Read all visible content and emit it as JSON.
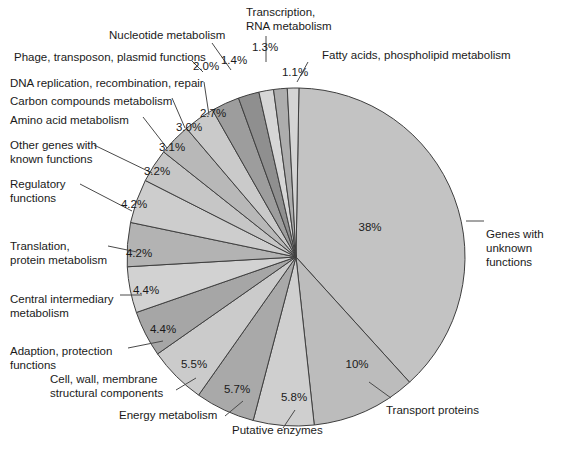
{
  "chart_data": {
    "type": "pie",
    "title": "",
    "subtitle": "",
    "xlabel": "",
    "ylabel": "",
    "legend_position": "none",
    "grid": false,
    "value_unit": "%",
    "categories": [
      "Genes with unknown functions",
      "Transport proteins",
      "Putative enzymes",
      "Energy metabolism",
      "Cell, wall, membrane structural components",
      "Adaption, protection functions",
      "Central intermediary metabolism",
      "Translation, protein metabolism",
      "Regulatory functions",
      "Other genes with known functions",
      "Amino acid metabolism",
      "Carbon compounds metabolism",
      "DNA replication, recombination, repair",
      "Phage, transposon, plasmid functions",
      "Nucleotide metabolism",
      "Transcription, RNA metabolism",
      "Fatty acids, phospholipid metabolism"
    ],
    "values": [
      38,
      10,
      5.8,
      5.7,
      5.5,
      4.4,
      4.4,
      4.2,
      4.2,
      3.2,
      3.1,
      3.0,
      2.7,
      2.0,
      1.4,
      1.3,
      1.1
    ],
    "value_labels": [
      "38%",
      "10%",
      "5.8%",
      "5.7%",
      "5.5%",
      "4.4%",
      "4.4%",
      "4.2%",
      "4.2%",
      "3.2%",
      "3.1%",
      "3.0%",
      "2.7%",
      "2.0%",
      "1.4%",
      "1.3%",
      "1.1%"
    ],
    "colors": [
      "#c3c3c3",
      "#bcbcbc",
      "#cfcfcf",
      "#a9a9a9",
      "#cbcbcb",
      "#a6a6a6",
      "#d2d2d2",
      "#b3b3b3",
      "#cdcdcd",
      "#c6c6c6",
      "#b8b8b8",
      "#cacaca",
      "#9d9d9d",
      "#8f8f8f",
      "#d6d6d6",
      "#adadad",
      "#d4d4d4"
    ]
  },
  "slices": [
    {
      "id": "genes-unknown",
      "label": "Genes with\nunknown functions",
      "pct": "38%",
      "value": 38,
      "color": "#c3c3c3"
    },
    {
      "id": "transport-proteins",
      "label": "Transport proteins",
      "pct": "10%",
      "value": 10,
      "color": "#bcbcbc"
    },
    {
      "id": "putative-enzymes",
      "label": "Putative enzymes",
      "pct": "5.8%",
      "value": 5.8,
      "color": "#cfcfcf"
    },
    {
      "id": "energy-metabolism",
      "label": "Energy metabolism",
      "pct": "5.7%",
      "value": 5.7,
      "color": "#a9a9a9"
    },
    {
      "id": "cell-wall-membrane",
      "label": "Cell, wall, membrane\nstructural components",
      "pct": "5.5%",
      "value": 5.5,
      "color": "#cbcbcb"
    },
    {
      "id": "adaption-protection",
      "label": "Adaption, protection\nfunctions",
      "pct": "4.4%",
      "value": 4.4,
      "color": "#a6a6a6"
    },
    {
      "id": "central-intermediary",
      "label": "Central intermediary\nmetabolism",
      "pct": "4.4%",
      "value": 4.4,
      "color": "#d2d2d2"
    },
    {
      "id": "translation-protein",
      "label": "Translation,\nprotein metabolism",
      "pct": "4.2%",
      "value": 4.2,
      "color": "#b3b3b3"
    },
    {
      "id": "regulatory-functions",
      "label": "Regulatory\nfunctions",
      "pct": "4.2%",
      "value": 4.2,
      "color": "#cdcdcd"
    },
    {
      "id": "other-known",
      "label": "Other genes with\nknown functions",
      "pct": "3.2%",
      "value": 3.2,
      "color": "#c6c6c6"
    },
    {
      "id": "amino-acid",
      "label": "Amino acid metabolism",
      "pct": "3.1%",
      "value": 3.1,
      "color": "#b8b8b8"
    },
    {
      "id": "carbon-compounds",
      "label": "Carbon compounds metabolism",
      "pct": "3.0%",
      "value": 3.0,
      "color": "#cacaca"
    },
    {
      "id": "dna-replication",
      "label": "DNA replication, recombination, repair",
      "pct": "2.7%",
      "value": 2.7,
      "color": "#9d9d9d"
    },
    {
      "id": "phage-transposon",
      "label": "Phage, transposon, plasmid functions",
      "pct": "2.0%",
      "value": 2.0,
      "color": "#8f8f8f"
    },
    {
      "id": "nucleotide",
      "label": "Nucleotide metabolism",
      "pct": "1.4%",
      "value": 1.4,
      "color": "#d6d6d6"
    },
    {
      "id": "transcription-rna",
      "label": "Transcription,\nRNA metabolism",
      "pct": "1.3%",
      "value": 1.3,
      "color": "#adadad"
    },
    {
      "id": "fatty-acids",
      "label": "Fatty acids, phospholipid metabolism",
      "pct": "1.1%",
      "value": 1.1,
      "color": "#d4d4d4"
    }
  ],
  "geometry": {
    "cx": 296,
    "cy": 257,
    "r": 169,
    "start_angle_deg": -89
  },
  "label_positions": {
    "genes-unknown": {
      "x": 486,
      "y": 227,
      "align": "left"
    },
    "transport-proteins": {
      "x": 386,
      "y": 403,
      "align": "left"
    },
    "putative-enzymes": {
      "x": 232,
      "y": 423,
      "align": "left"
    },
    "energy-metabolism": {
      "x": 119,
      "y": 408,
      "align": "left"
    },
    "cell-wall-membrane": {
      "x": 50,
      "y": 372,
      "align": "left"
    },
    "adaption-protection": {
      "x": 10,
      "y": 344,
      "align": "left"
    },
    "central-intermediary": {
      "x": 10,
      "y": 292,
      "align": "left"
    },
    "translation-protein": {
      "x": 10,
      "y": 239,
      "align": "left"
    },
    "regulatory-functions": {
      "x": 10,
      "y": 177,
      "align": "left"
    },
    "other-known": {
      "x": 10,
      "y": 138,
      "align": "left"
    },
    "amino-acid": {
      "x": 10,
      "y": 113,
      "align": "left"
    },
    "carbon-compounds": {
      "x": 10,
      "y": 94,
      "align": "left"
    },
    "dna-replication": {
      "x": 10,
      "y": 76,
      "align": "left"
    },
    "phage-transposon": {
      "x": 14,
      "y": 50,
      "align": "left"
    },
    "nucleotide": {
      "x": 109,
      "y": 28,
      "align": "left"
    },
    "transcription-rna": {
      "x": 246,
      "y": 5,
      "align": "left"
    },
    "fatty-acids": {
      "x": 322,
      "y": 48,
      "align": "left"
    }
  },
  "pct_positions": {
    "genes-unknown": {
      "x": 370,
      "y": 231
    },
    "transport-proteins": {
      "x": 357,
      "y": 368
    },
    "putative-enzymes": {
      "x": 294,
      "y": 401
    },
    "energy-metabolism": {
      "x": 237,
      "y": 393
    },
    "cell-wall-membrane": {
      "x": 194,
      "y": 368
    },
    "adaption-protection": {
      "x": 163,
      "y": 333
    },
    "central-intermediary": {
      "x": 146,
      "y": 294
    },
    "translation-protein": {
      "x": 139,
      "y": 257
    },
    "regulatory-functions": {
      "x": 134,
      "y": 208
    },
    "other-known": {
      "x": 157,
      "y": 175
    },
    "amino-acid": {
      "x": 172,
      "y": 151
    },
    "carbon-compounds": {
      "x": 189,
      "y": 131
    },
    "dna-replication": {
      "x": 213,
      "y": 117
    },
    "phage-transposon": {
      "x": 206,
      "y": 70
    },
    "nucleotide": {
      "x": 234,
      "y": 64
    },
    "transcription-rna": {
      "x": 265,
      "y": 51
    },
    "fatty-acids": {
      "x": 295,
      "y": 76
    }
  },
  "leaders": {
    "genes-unknown": [
      [
        466,
        221
      ],
      [
        484,
        221
      ]
    ],
    "transport-proteins": [
      [
        369,
        382
      ],
      [
        391,
        398
      ]
    ],
    "putative-enzymes": [
      [
        295,
        410
      ],
      [
        283,
        428
      ]
    ],
    "energy-metabolism": [
      [
        243,
        401
      ],
      [
        225,
        416
      ]
    ],
    "cell-wall-membrane": [
      [
        196,
        378
      ],
      [
        176,
        390
      ]
    ],
    "adaption-protection": [
      [
        163,
        341
      ],
      [
        128,
        348
      ]
    ],
    "central-intermediary": [
      [
        142,
        295
      ],
      [
        120,
        295
      ]
    ],
    "translation-protein": [
      [
        137,
        252
      ],
      [
        108,
        246
      ]
    ],
    "regulatory-functions": [
      [
        132,
        211
      ],
      [
        80,
        184
      ]
    ],
    "other-known": [
      [
        152,
        173
      ],
      [
        94,
        145
      ]
    ],
    "amino-acid": [
      [
        167,
        148
      ],
      [
        143,
        117
      ]
    ],
    "carbon-compounds": [
      [
        185,
        128
      ],
      [
        172,
        98
      ]
    ],
    "dna-replication": [
      [
        209,
        115
      ],
      [
        204,
        82
      ]
    ],
    "phage-transposon": [
      [
        203,
        72
      ],
      [
        192,
        61
      ]
    ],
    "nucleotide": [
      [
        231,
        70
      ],
      [
        212,
        43
      ]
    ],
    "transcription-rna": [
      [
        266,
        62
      ],
      [
        266,
        36
      ]
    ],
    "fatty-acids": [
      [
        297,
        82
      ],
      [
        308,
        62
      ]
    ]
  }
}
